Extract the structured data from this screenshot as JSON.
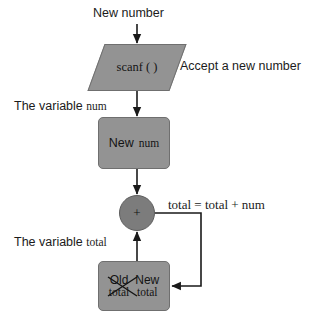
{
  "diagram": {
    "background": "#ffffff",
    "shape_fill": "#939393",
    "shape_stroke": "#6f6f6f",
    "circle_fill": "#7c7c7c",
    "text_color": "#141414",
    "line_color": "#1a1a1a"
  },
  "labels": {
    "new_number": "New number",
    "accept": "Accept a new number",
    "variable_num": "The variable",
    "variable_num_name": "num",
    "equation": "total = total + num",
    "variable_total": "The variable",
    "variable_total_name": "total"
  },
  "nodes": {
    "scanf": {
      "shape": "parallelogram",
      "text": "scanf ( )"
    },
    "new_num": {
      "shape": "rounded-rect",
      "word1": "New",
      "word2": "num"
    },
    "plus": {
      "shape": "circle",
      "text": "+"
    },
    "total": {
      "shape": "rounded-rect",
      "old_word1": "Old",
      "old_word2": "total",
      "new_word1": "New",
      "new_word2": "total",
      "old_struck_out": true
    }
  },
  "edges": [
    {
      "name": "new-number-to-scanf",
      "from": "New number",
      "to": "scanf ( )"
    },
    {
      "name": "scanf-to-new-num",
      "from": "scanf ( )",
      "to": "New num"
    },
    {
      "name": "new-num-to-plus",
      "from": "New num",
      "to": "+"
    },
    {
      "name": "total-to-plus",
      "from": "New total",
      "to": "+"
    },
    {
      "name": "plus-feedback-to-total",
      "from": "+",
      "to": "New total",
      "label": "total = total + num"
    }
  ]
}
